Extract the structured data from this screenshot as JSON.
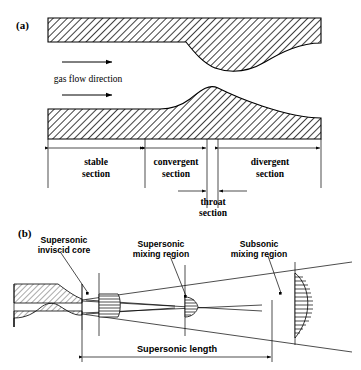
{
  "figure": {
    "panel_a": {
      "label": "(a)",
      "flow_label": "gas flow direction",
      "sections": [
        {
          "name": "stable-section",
          "line1": "stable",
          "line2": "section"
        },
        {
          "name": "convergent-section",
          "line1": "convergent",
          "line2": "section"
        },
        {
          "name": "divergent-section",
          "line1": "divergent",
          "line2": "section"
        },
        {
          "name": "throat-section",
          "line1": "throat",
          "line2": "section"
        }
      ]
    },
    "panel_b": {
      "label": "(b)",
      "callouts": [
        {
          "name": "supersonic-inviscid-core",
          "line1": "Supersonic",
          "line2": "inviscid core"
        },
        {
          "name": "supersonic-mixing-region",
          "line1": "Supersonic",
          "line2": "mixing region"
        },
        {
          "name": "subsonic-mixing-region",
          "line1": "Subsonic",
          "line2": "mixing region"
        }
      ],
      "dimension": {
        "name": "supersonic-length",
        "label": "Supersonic length"
      }
    },
    "colors": {
      "stroke": "#000000",
      "background": "#ffffff",
      "hatch": "#000000"
    }
  }
}
